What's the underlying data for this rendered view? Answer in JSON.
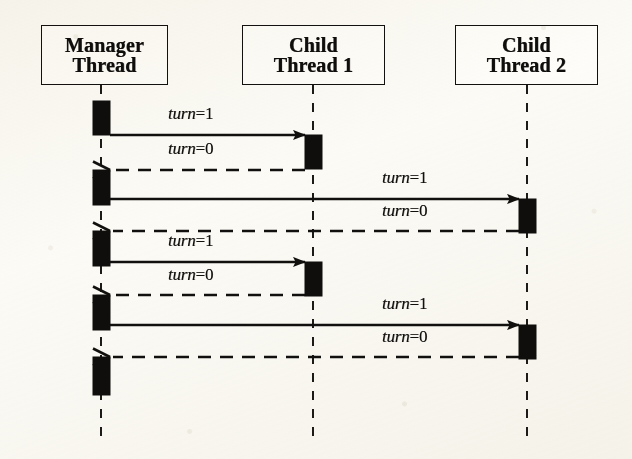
{
  "diagram": {
    "kind": "uml-sequence-diagram",
    "width": 632,
    "height": 459,
    "colors": {
      "ink": "#12100e",
      "paper": "#fdfdfb",
      "activation_fill": "#100e0c"
    },
    "participants": [
      {
        "id": "manager",
        "name": "Manager Thread",
        "lines": [
          "Manager",
          "Thread"
        ],
        "lifeline_x": 101,
        "box": {
          "x": 41,
          "y": 25,
          "w": 127,
          "h": 60
        }
      },
      {
        "id": "child1",
        "name": "Child Thread 1",
        "lines": [
          "Child",
          "Thread 1"
        ],
        "lifeline_x": 313,
        "box": {
          "x": 242,
          "y": 25,
          "w": 143,
          "h": 60
        }
      },
      {
        "id": "child2",
        "name": "Child Thread 2",
        "lines": [
          "Child",
          "Thread 2"
        ],
        "lifeline_x": 527,
        "box": {
          "x": 455,
          "y": 25,
          "w": 143,
          "h": 60
        }
      }
    ],
    "lifeline_top": 85,
    "lifeline_bottom": 436,
    "activations": [
      {
        "participant": "manager",
        "x": 93,
        "y": 101,
        "w": 17,
        "h": 34
      },
      {
        "participant": "manager",
        "x": 93,
        "y": 170,
        "w": 17,
        "h": 35
      },
      {
        "participant": "manager",
        "x": 93,
        "y": 231,
        "w": 17,
        "h": 35
      },
      {
        "participant": "manager",
        "x": 93,
        "y": 295,
        "w": 17,
        "h": 35
      },
      {
        "participant": "manager",
        "x": 93,
        "y": 357,
        "w": 17,
        "h": 38
      },
      {
        "participant": "child1",
        "x": 305,
        "y": 135,
        "w": 17,
        "h": 34
      },
      {
        "participant": "child1",
        "x": 305,
        "y": 262,
        "w": 17,
        "h": 34
      },
      {
        "participant": "child2",
        "x": 519,
        "y": 199,
        "w": 17,
        "h": 34
      },
      {
        "participant": "child2",
        "x": 519,
        "y": 325,
        "w": 17,
        "h": 34
      }
    ],
    "messages": [
      {
        "seq": 1,
        "label": "turn=1",
        "var": "turn",
        "op": "=",
        "value": "1",
        "kind": "call",
        "style": "solid",
        "from": "manager",
        "to": "child1",
        "x1": 110,
        "x2": 305,
        "y": 135,
        "label_x": 168,
        "label_y": 104,
        "direction": "right"
      },
      {
        "seq": 2,
        "label": "turn=0",
        "var": "turn",
        "op": "=",
        "value": "0",
        "kind": "return",
        "style": "dashed",
        "from": "child1",
        "to": "manager",
        "x1": 305,
        "x2": 110,
        "y": 170,
        "label_x": 168,
        "label_y": 139,
        "direction": "left"
      },
      {
        "seq": 3,
        "label": "turn=1",
        "var": "turn",
        "op": "=",
        "value": "1",
        "kind": "call",
        "style": "solid",
        "from": "manager",
        "to": "child2",
        "x1": 110,
        "x2": 519,
        "y": 199,
        "label_x": 382,
        "label_y": 168,
        "direction": "right"
      },
      {
        "seq": 4,
        "label": "turn=0",
        "var": "turn",
        "op": "=",
        "value": "0",
        "kind": "return",
        "style": "dashed",
        "from": "child2",
        "to": "manager",
        "x1": 519,
        "x2": 110,
        "y": 231,
        "label_x": 382,
        "label_y": 201,
        "direction": "left"
      },
      {
        "seq": 5,
        "label": "turn=1",
        "var": "turn",
        "op": "=",
        "value": "1",
        "kind": "call",
        "style": "solid",
        "from": "manager",
        "to": "child1",
        "x1": 110,
        "x2": 305,
        "y": 262,
        "label_x": 168,
        "label_y": 231,
        "direction": "right"
      },
      {
        "seq": 6,
        "label": "turn=0",
        "var": "turn",
        "op": "=",
        "value": "0",
        "kind": "return",
        "style": "dashed",
        "from": "child1",
        "to": "manager",
        "x1": 305,
        "x2": 110,
        "y": 295,
        "label_x": 168,
        "label_y": 265,
        "direction": "left"
      },
      {
        "seq": 7,
        "label": "turn=1",
        "var": "turn",
        "op": "=",
        "value": "1",
        "kind": "call",
        "style": "solid",
        "from": "manager",
        "to": "child2",
        "x1": 110,
        "x2": 519,
        "y": 325,
        "label_x": 382,
        "label_y": 294,
        "direction": "right"
      },
      {
        "seq": 8,
        "label": "turn=0",
        "var": "turn",
        "op": "=",
        "value": "0",
        "kind": "return",
        "style": "dashed",
        "from": "child2",
        "to": "manager",
        "x1": 519,
        "x2": 110,
        "y": 357,
        "label_x": 382,
        "label_y": 327,
        "direction": "left"
      }
    ]
  }
}
